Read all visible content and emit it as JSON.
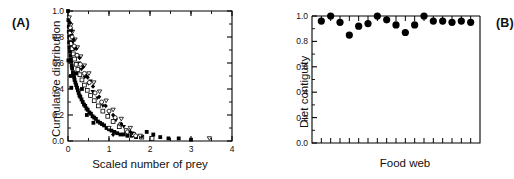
{
  "figure": {
    "panels": [
      {
        "id": "A",
        "label": "(A)",
        "xlabel": "Scaled number of prey",
        "ylabel": "Cumulative distribution"
      },
      {
        "id": "B",
        "label": "(B)",
        "xlabel": "Food web",
        "ylabel": "Diet contiguity"
      }
    ]
  },
  "chart_data": [
    {
      "type": "scatter",
      "panel": "A",
      "title": "",
      "xlabel": "Scaled number of prey",
      "ylabel": "Cumulative distribution",
      "xlim": [
        0,
        4
      ],
      "ylim": [
        0,
        1
      ],
      "xticks": [
        0,
        1,
        2,
        3,
        4
      ],
      "xtick_labels": [
        "0",
        "1",
        "2",
        "3",
        "4"
      ],
      "yticks": [
        0.0,
        0.2,
        0.4,
        0.6,
        0.8,
        1.0
      ],
      "ytick_labels": [
        "0.0",
        "0.2",
        "0.4",
        "0.6",
        "0.8",
        "1.0"
      ],
      "minor_ticks": true,
      "grid": false,
      "legend": "none",
      "description": "Cumulative distributions of scaled number of prey for multiple food webs collapsing onto a single decaying curve.",
      "series": [
        {
          "name": "filled-square",
          "marker": "filled-square",
          "points": [
            [
              0.0,
              1.0
            ],
            [
              0.01,
              0.93
            ],
            [
              0.02,
              0.88
            ],
            [
              0.02,
              0.84
            ],
            [
              0.03,
              0.8
            ],
            [
              0.03,
              0.76
            ],
            [
              0.04,
              0.72
            ],
            [
              0.05,
              0.69
            ],
            [
              0.01,
              0.62
            ],
            [
              0.06,
              0.66
            ],
            [
              0.07,
              0.63
            ],
            [
              0.08,
              0.61
            ],
            [
              0.09,
              0.58
            ],
            [
              0.1,
              0.56
            ],
            [
              0.12,
              0.53
            ],
            [
              0.13,
              0.51
            ],
            [
              0.15,
              0.49
            ],
            [
              0.16,
              0.47
            ],
            [
              0.18,
              0.45
            ],
            [
              0.2,
              0.43
            ],
            [
              0.07,
              0.5
            ],
            [
              0.08,
              0.41
            ],
            [
              0.22,
              0.41
            ],
            [
              0.24,
              0.39
            ],
            [
              0.26,
              0.37
            ],
            [
              0.28,
              0.35
            ],
            [
              0.3,
              0.34
            ],
            [
              0.33,
              0.32
            ],
            [
              0.36,
              0.3
            ],
            [
              0.39,
              0.28
            ],
            [
              0.42,
              0.27
            ],
            [
              0.45,
              0.25
            ],
            [
              0.48,
              0.24
            ],
            [
              0.52,
              0.22
            ],
            [
              0.56,
              0.21
            ],
            [
              0.6,
              0.19
            ],
            [
              0.64,
              0.18
            ],
            [
              0.68,
              0.17
            ],
            [
              0.73,
              0.15
            ],
            [
              0.78,
              0.14
            ],
            [
              0.83,
              0.13
            ],
            [
              0.88,
              0.12
            ],
            [
              0.94,
              0.1
            ],
            [
              1.0,
              0.09
            ],
            [
              1.06,
              0.08
            ],
            [
              1.13,
              0.07
            ],
            [
              1.2,
              0.06
            ],
            [
              1.28,
              0.05
            ],
            [
              1.36,
              0.05
            ],
            [
              1.45,
              0.04
            ],
            [
              1.55,
              0.04
            ],
            [
              1.66,
              0.03
            ],
            [
              1.78,
              0.03
            ],
            [
              1.92,
              0.07
            ],
            [
              2.08,
              0.05
            ],
            [
              2.25,
              0.03
            ],
            [
              2.45,
              0.02
            ],
            [
              2.7,
              0.02
            ],
            [
              3.0,
              0.01
            ],
            [
              0.34,
              0.4
            ],
            [
              0.2,
              0.52
            ],
            [
              0.46,
              0.2
            ],
            [
              0.62,
              0.14
            ]
          ]
        },
        {
          "name": "open-square",
          "marker": "open-square",
          "points": [
            [
              0.05,
              0.83
            ],
            [
              0.06,
              0.79
            ],
            [
              0.08,
              0.75
            ],
            [
              0.1,
              0.71
            ],
            [
              0.13,
              0.67
            ],
            [
              0.16,
              0.63
            ],
            [
              0.2,
              0.59
            ],
            [
              0.24,
              0.55
            ],
            [
              0.29,
              0.51
            ],
            [
              0.34,
              0.47
            ],
            [
              0.4,
              0.43
            ],
            [
              0.47,
              0.39
            ],
            [
              0.55,
              0.35
            ],
            [
              0.64,
              0.31
            ],
            [
              0.74,
              0.27
            ],
            [
              0.85,
              0.23
            ],
            [
              0.97,
              0.19
            ],
            [
              1.1,
              0.15
            ],
            [
              1.25,
              0.11
            ],
            [
              1.42,
              0.08
            ],
            [
              1.6,
              0.05
            ],
            [
              1.8,
              0.03
            ],
            [
              2.05,
              0.02
            ]
          ]
        },
        {
          "name": "filled-triangle-down",
          "marker": "filled-triangle-down",
          "points": [
            [
              0.04,
              0.9
            ],
            [
              0.06,
              0.86
            ],
            [
              0.09,
              0.81
            ],
            [
              0.12,
              0.76
            ],
            [
              0.16,
              0.71
            ],
            [
              0.21,
              0.66
            ],
            [
              0.27,
              0.6
            ],
            [
              0.33,
              0.55
            ],
            [
              0.41,
              0.49
            ],
            [
              0.5,
              0.44
            ],
            [
              0.6,
              0.38
            ],
            [
              0.72,
              0.33
            ],
            [
              0.85,
              0.27
            ],
            [
              1.0,
              0.22
            ],
            [
              1.17,
              0.16
            ],
            [
              1.36,
              0.11
            ],
            [
              1.57,
              0.06
            ],
            [
              1.8,
              0.03
            ],
            [
              0.55,
              0.46
            ]
          ]
        },
        {
          "name": "open-triangle-down",
          "marker": "open-triangle-down",
          "points": [
            [
              0.03,
              0.95
            ],
            [
              0.07,
              0.89
            ],
            [
              0.11,
              0.84
            ],
            [
              0.17,
              0.78
            ],
            [
              0.23,
              0.72
            ],
            [
              0.31,
              0.65
            ],
            [
              0.4,
              0.58
            ],
            [
              0.51,
              0.52
            ],
            [
              0.63,
              0.45
            ],
            [
              0.77,
              0.38
            ],
            [
              0.93,
              0.31
            ],
            [
              1.1,
              0.24
            ],
            [
              1.0,
              0.1
            ],
            [
              1.3,
              0.17
            ],
            [
              1.52,
              0.1
            ],
            [
              1.76,
              0.04
            ],
            [
              3.45,
              0.02
            ]
          ]
        },
        {
          "name": "open-circle",
          "marker": "open-circle",
          "points": [
            [
              0.06,
              0.87
            ],
            [
              0.1,
              0.8
            ],
            [
              0.15,
              0.73
            ],
            [
              0.22,
              0.66
            ],
            [
              0.3,
              0.59
            ],
            [
              0.4,
              0.52
            ],
            [
              0.52,
              0.45
            ],
            [
              0.66,
              0.37
            ],
            [
              0.82,
              0.3
            ],
            [
              1.0,
              0.23
            ],
            [
              1.15,
              0.18
            ],
            [
              1.28,
              0.13
            ],
            [
              1.45,
              0.07
            ],
            [
              1.65,
              0.04
            ]
          ]
        },
        {
          "name": "filled-diamond",
          "marker": "filled-diamond",
          "points": [
            [
              0.05,
              0.91
            ],
            [
              0.09,
              0.85
            ],
            [
              0.14,
              0.78
            ],
            [
              0.2,
              0.71
            ],
            [
              0.28,
              0.64
            ],
            [
              0.37,
              0.57
            ],
            [
              0.48,
              0.49
            ],
            [
              0.61,
              0.42
            ],
            [
              0.76,
              0.34
            ],
            [
              0.92,
              0.27
            ],
            [
              1.1,
              0.2
            ],
            [
              1.3,
              0.13
            ],
            [
              1.52,
              0.07
            ],
            [
              1.1,
              0.05
            ],
            [
              0.45,
              0.5
            ]
          ]
        }
      ]
    },
    {
      "type": "scatter",
      "panel": "B",
      "title": "",
      "xlabel": "Food web",
      "ylabel": "Diet contiguity",
      "xlim": [
        0,
        18
      ],
      "ylim": [
        0,
        1
      ],
      "yticks": [
        0.0,
        0.2,
        0.4,
        0.6,
        0.8,
        1.0
      ],
      "ytick_labels": [
        "0.0",
        "0.2",
        "0.4",
        "0.6",
        "0.8",
        "1.0"
      ],
      "xticks": [
        1,
        2,
        3,
        4,
        5,
        6,
        7,
        8,
        9,
        10,
        11,
        12,
        13,
        14,
        15,
        16,
        17
      ],
      "xtick_labels": [
        "",
        "",
        "",
        "",
        "",
        "",
        "",
        "",
        "",
        "",
        "",
        "",
        "",
        "",
        "",
        "",
        ""
      ],
      "grid": false,
      "legend": "none",
      "marker": "filled-circle",
      "description": "Diet contiguity value for each of 17 empirical food webs, all near 0.85-1.00.",
      "x": [
        1,
        2,
        3,
        4,
        5,
        6,
        7,
        8,
        9,
        10,
        11,
        12,
        13,
        14,
        15,
        16,
        17
      ],
      "values": [
        0.96,
        1.0,
        0.95,
        0.85,
        0.92,
        0.94,
        1.0,
        0.97,
        0.93,
        0.87,
        0.93,
        1.0,
        0.96,
        0.96,
        0.95,
        0.96,
        0.95
      ]
    }
  ],
  "style": {
    "marker_color": "#000000",
    "axis_color": "#000000",
    "background": "#ffffff"
  }
}
